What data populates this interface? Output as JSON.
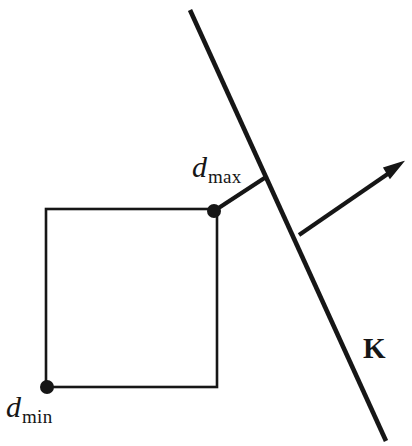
{
  "figure": {
    "background_color": "#ffffff",
    "stroke_color": "#161616",
    "width": 412,
    "height": 446,
    "labels": {
      "d_max": {
        "symbol": "d",
        "subscript": "max"
      },
      "d_min": {
        "symbol": "d",
        "subscript": "min"
      },
      "k_vector": "K"
    },
    "geometry": {
      "rectangle": {
        "x": 46,
        "y": 209,
        "width": 171,
        "height": 178,
        "stroke_width": 2.6
      },
      "boundary_line": {
        "x1": 190,
        "y1": 10,
        "x2": 386,
        "y2": 441,
        "stroke_width": 4.6
      },
      "normal_arrow": {
        "x1": 299,
        "y1": 235,
        "x2": 402,
        "y2": 164,
        "stroke_width": 4.2
      },
      "connector_segment": {
        "x1": 214,
        "y1": 211,
        "x2": 265,
        "y2": 178,
        "stroke_width": 4.2
      },
      "point_dmax": {
        "cx": 214,
        "cy": 211,
        "r": 7
      },
      "point_dmin": {
        "cx": 47,
        "cy": 387,
        "r": 7
      }
    }
  }
}
